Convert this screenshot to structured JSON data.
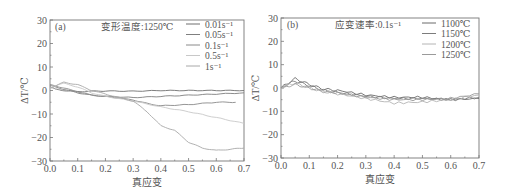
{
  "chart_data": [
    {
      "type": "line",
      "panel": "(a)",
      "title": "变形温度:1250℃",
      "xlabel": "真应变",
      "ylabel": "ΔT/℃",
      "xlim": [
        0.0,
        0.7
      ],
      "ylim": [
        -30,
        30
      ],
      "xticks": [
        "0.0",
        "0.1",
        "0.2",
        "0.3",
        "0.4",
        "0.5",
        "0.6",
        "0.7"
      ],
      "yticks": [
        "30",
        "20",
        "10",
        "0",
        "-10",
        "-20",
        "-30"
      ],
      "legend_position": "upper right",
      "grid": false,
      "series": [
        {
          "name": "0.01s⁻¹",
          "color": "#6f6f6f",
          "x": [
            0.0,
            0.02,
            0.05,
            0.1,
            0.15,
            0.2,
            0.3,
            0.4,
            0.5,
            0.6,
            0.7
          ],
          "y": [
            1.5,
            0.5,
            0.0,
            -0.5,
            -0.3,
            -0.2,
            -0.3,
            0.0,
            0.0,
            0.0,
            0.0
          ]
        },
        {
          "name": "0.05s⁻¹",
          "color": "#7f7f7f",
          "x": [
            0.0,
            0.02,
            0.05,
            0.1,
            0.15,
            0.2,
            0.3,
            0.4,
            0.5,
            0.6,
            0.7
          ],
          "y": [
            2.0,
            1.5,
            0.5,
            -1.0,
            -2.0,
            -2.5,
            -3.0,
            -2.5,
            -2.0,
            -1.5,
            -1.0
          ]
        },
        {
          "name": "0.1s⁻¹",
          "color": "#8a8a8a",
          "x": [
            0.0,
            0.02,
            0.05,
            0.1,
            0.15,
            0.2,
            0.3,
            0.35,
            0.4,
            0.5,
            0.6,
            0.67
          ],
          "y": [
            2.5,
            2.0,
            1.0,
            -0.5,
            -2.0,
            -2.5,
            -4.0,
            -5.5,
            -6.5,
            -6.0,
            -5.0,
            -5.0
          ]
        },
        {
          "name": "0.5s⁻¹",
          "color": "#c8c8c8",
          "x": [
            0.0,
            0.03,
            0.05,
            0.1,
            0.15,
            0.2,
            0.3,
            0.4,
            0.5,
            0.6,
            0.7
          ],
          "y": [
            1.0,
            2.5,
            3.0,
            1.5,
            -1.0,
            -2.5,
            -4.5,
            -7.0,
            -9.0,
            -11.5,
            -14.0
          ]
        },
        {
          "name": "1s⁻¹",
          "color": "#a8a8a8",
          "x": [
            0.0,
            0.03,
            0.05,
            0.1,
            0.15,
            0.2,
            0.25,
            0.3,
            0.35,
            0.4,
            0.45,
            0.5,
            0.55,
            0.6,
            0.65,
            0.7
          ],
          "y": [
            1.0,
            2.5,
            3.5,
            2.5,
            0.0,
            -1.5,
            -3.0,
            -4.5,
            -9.0,
            -15.0,
            -17.0,
            -22.0,
            -24.5,
            -25.5,
            -25.0,
            -24.5
          ]
        }
      ]
    },
    {
      "type": "line",
      "panel": "(b)",
      "title": "应变速率:0.1s⁻¹",
      "xlabel": "真应变",
      "ylabel": "ΔT/℃",
      "xlim": [
        0.0,
        0.7
      ],
      "ylim": [
        -30,
        30
      ],
      "xticks": [
        "0.0",
        "0.1",
        "0.2",
        "0.3",
        "0.4",
        "0.5",
        "0.6",
        "0.7"
      ],
      "yticks": [
        "30",
        "20",
        "10",
        "0",
        "-10",
        "-20",
        "-30"
      ],
      "legend_position": "upper right",
      "grid": false,
      "series": [
        {
          "name": "1100℃",
          "color": "#6a6a6a",
          "x": [
            0.0,
            0.03,
            0.05,
            0.1,
            0.15,
            0.2,
            0.3,
            0.4,
            0.5,
            0.6,
            0.7
          ],
          "y": [
            0.0,
            2.5,
            4.0,
            1.5,
            -0.5,
            -1.0,
            -3.0,
            -4.0,
            -4.0,
            -5.0,
            -4.5
          ]
        },
        {
          "name": "1150℃",
          "color": "#7c7c7c",
          "x": [
            0.0,
            0.03,
            0.05,
            0.1,
            0.15,
            0.2,
            0.3,
            0.4,
            0.5,
            0.6,
            0.7
          ],
          "y": [
            0.0,
            2.0,
            3.0,
            1.0,
            -1.0,
            -2.0,
            -3.5,
            -4.5,
            -4.5,
            -5.0,
            -4.0
          ]
        },
        {
          "name": "1200℃",
          "color": "#b4b4b4",
          "x": [
            0.0,
            0.03,
            0.05,
            0.1,
            0.15,
            0.2,
            0.3,
            0.4,
            0.5,
            0.6,
            0.7
          ],
          "y": [
            0.0,
            1.5,
            2.0,
            0.0,
            -1.5,
            -2.5,
            -4.5,
            -6.5,
            -6.0,
            -5.0,
            -3.0
          ]
        },
        {
          "name": "1250℃",
          "color": "#9a9a9a",
          "x": [
            0.0,
            0.03,
            0.05,
            0.1,
            0.15,
            0.2,
            0.3,
            0.4,
            0.5,
            0.6,
            0.7
          ],
          "y": [
            0.0,
            1.0,
            1.5,
            0.0,
            -1.5,
            -2.0,
            -4.0,
            -5.0,
            -5.0,
            -4.5,
            -2.5
          ]
        }
      ]
    }
  ]
}
